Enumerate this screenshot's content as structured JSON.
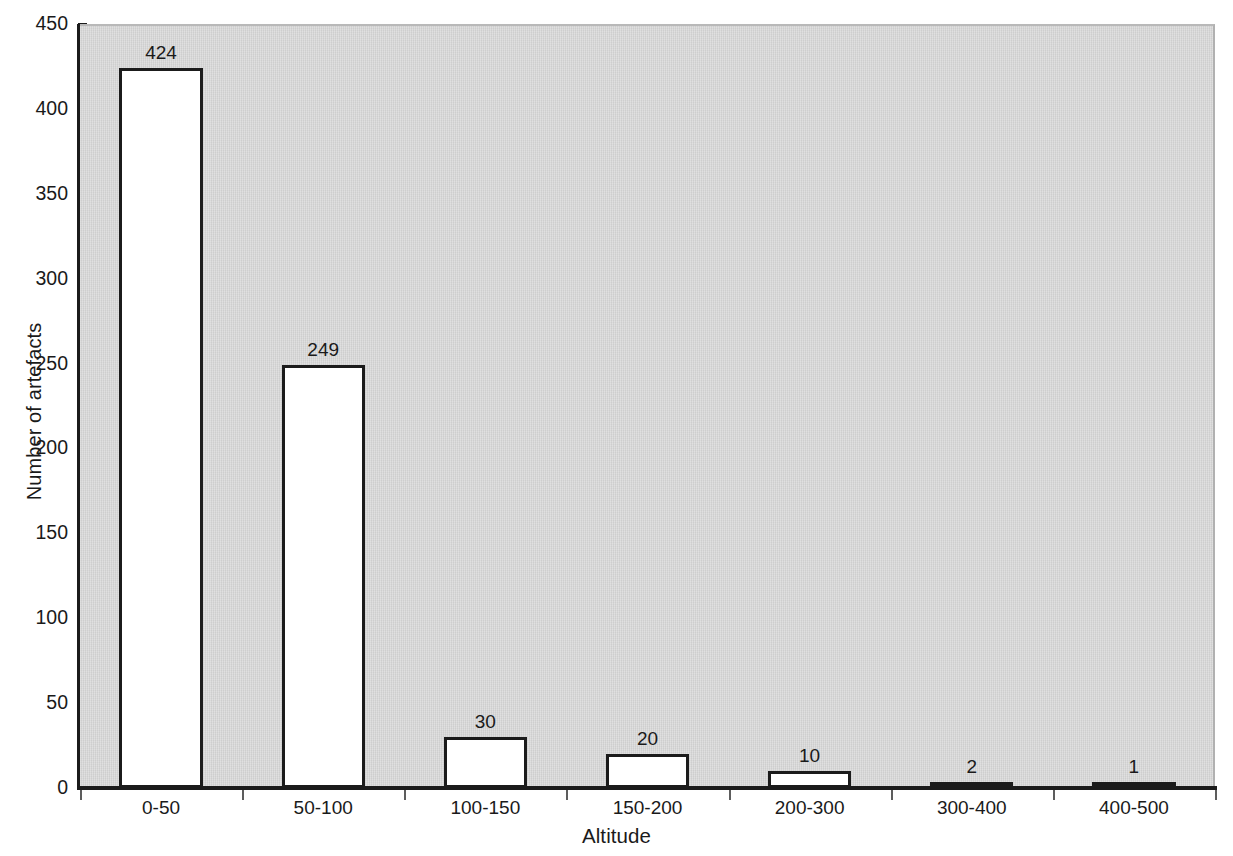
{
  "chart_data": {
    "type": "bar",
    "title": "",
    "xlabel": "Altitude",
    "ylabel": "Number of artefacts",
    "categories": [
      "0-50",
      "50-100",
      "100-150",
      "150-200",
      "200-300",
      "300-400",
      "400-500"
    ],
    "values": [
      424,
      249,
      30,
      20,
      10,
      2,
      1
    ],
    "value_labels": [
      "424",
      "249",
      "30",
      "20",
      "10",
      "2",
      "1"
    ],
    "ylim": [
      0,
      450
    ],
    "ytick_values": [
      0,
      50,
      100,
      150,
      200,
      250,
      300,
      350,
      400,
      450
    ],
    "ytick_labels": [
      "0",
      "50",
      "100",
      "150",
      "200",
      "250",
      "300",
      "350",
      "400",
      "450"
    ],
    "grid": false,
    "legend": "none",
    "bar_fill_color": "#ffffff",
    "bar_edge_color": "#1b1b1b",
    "plot_background_color": "#d2d2d2",
    "figure_background_color": "#ffffff",
    "axis_color": "#1b1b1b",
    "text_color": "#1a1a1a"
  }
}
